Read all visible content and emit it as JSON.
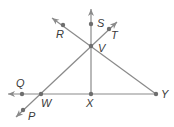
{
  "diagram": {
    "type": "geometry-lines",
    "points": [
      {
        "id": "S",
        "label": "S",
        "x": 91,
        "y": 24,
        "lx": 97,
        "ly": 27
      },
      {
        "id": "R",
        "label": "R",
        "x": 63,
        "y": 25,
        "lx": 56,
        "ly": 38
      },
      {
        "id": "T",
        "label": "T",
        "x": 109,
        "y": 29,
        "lx": 111,
        "ly": 39
      },
      {
        "id": "V",
        "label": "V",
        "x": 91,
        "y": 46,
        "lx": 98,
        "ly": 52
      },
      {
        "id": "Q",
        "label": "Q",
        "x": 22,
        "y": 94,
        "lx": 16,
        "ly": 87
      },
      {
        "id": "W",
        "label": "W",
        "x": 41,
        "y": 94,
        "lx": 41,
        "ly": 107
      },
      {
        "id": "X",
        "label": "X",
        "x": 91,
        "y": 94,
        "lx": 86,
        "ly": 107
      },
      {
        "id": "Y",
        "label": "Y",
        "x": 156,
        "y": 94,
        "lx": 161,
        "ly": 98
      },
      {
        "id": "P",
        "label": "P",
        "x": 23,
        "y": 110,
        "lx": 28,
        "ly": 120
      }
    ],
    "lines": [
      {
        "name": "ray-XS",
        "from": [
          91,
          94
        ],
        "to": [
          91,
          9
        ],
        "arrow_end": true
      },
      {
        "name": "ray-YR",
        "from": [
          156,
          94
        ],
        "to": [
          52,
          18
        ],
        "arrow_end": true
      },
      {
        "name": "line-PT",
        "from": [
          16,
          117
        ],
        "to": [
          117,
          22
        ],
        "arrow_start": true,
        "arrow_end": true
      },
      {
        "name": "ray-YQ",
        "from": [
          156,
          94
        ],
        "to": [
          8,
          94
        ],
        "arrow_end": true
      }
    ],
    "colors": {
      "line": "#8a8a8a",
      "point": "#6e6e6e",
      "label": "#3a3a3a"
    }
  }
}
